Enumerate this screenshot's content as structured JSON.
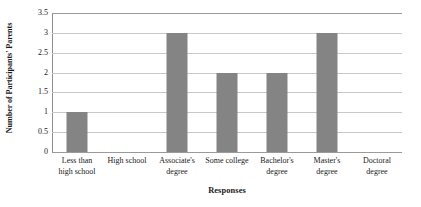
{
  "chart_data": {
    "type": "bar",
    "title": "",
    "categories": [
      "Less than high school",
      "High school",
      "Associate's degree",
      "Some college",
      "Bachelor's degree",
      "Master's degree",
      "Doctoral degree"
    ],
    "category_lines": [
      [
        "Less than",
        "high school"
      ],
      [
        "High school",
        ""
      ],
      [
        "Associate's",
        "degree"
      ],
      [
        "Some college",
        ""
      ],
      [
        "Bachelor's",
        "degree"
      ],
      [
        "Master's",
        "degree"
      ],
      [
        "Doctoral",
        "degree"
      ]
    ],
    "values": [
      1,
      0,
      3,
      2,
      2,
      3,
      0
    ],
    "xlabel": "Responses",
    "ylabel": "Number of Participants' Parents",
    "ylim": [
      0,
      3.5
    ],
    "ytick_labels": [
      "0",
      "0.5",
      "1",
      "1.5",
      "2",
      "2.5",
      "3",
      "3.5"
    ],
    "ytick_values": [
      0,
      0.5,
      1,
      1.5,
      2,
      2.5,
      3,
      3.5
    ],
    "grid": true,
    "legend": false,
    "bar_color": "#848484",
    "gridline_color": "#c8c8c8",
    "axis_color": "#8d8d8d",
    "background_color": "#ffffff"
  }
}
